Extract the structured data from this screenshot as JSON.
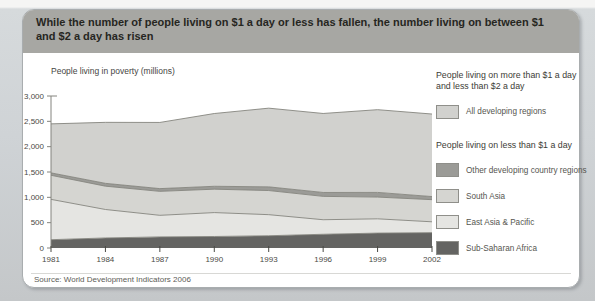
{
  "title": "While the number of people living on $1 a day or less has fallen, the number living on between $1 and $2 a day has risen",
  "source": "Source: World Development Indicators 2006",
  "colors": {
    "card_background": "#ffffff",
    "titlebar_background": "#a7a7a3",
    "page_background": "#cfd3d6",
    "axis": "#84847e",
    "sub_saharan_africa": "#646462",
    "east_asia_pacific": "#e5e5e2",
    "south_asia": "#d5d5d1",
    "other_developing": "#9b9b97",
    "all_developing_between_1_and_2": "#d1d1ce"
  },
  "chart_data": {
    "type": "area",
    "stacked": true,
    "ylabel": "People living in poverty (millions)",
    "xlabel": "",
    "grid": false,
    "ylim": [
      0,
      3000
    ],
    "years": [
      1981,
      1984,
      1987,
      1990,
      1993,
      1996,
      1999,
      2002
    ],
    "x_tick_labels": [
      "1981",
      "1984",
      "1987",
      "1990",
      "1993",
      "1996",
      "1999",
      "2002"
    ],
    "y_ticks": [
      0,
      500,
      1000,
      1500,
      2000,
      2500,
      3000
    ],
    "y_tick_labels": [
      "0",
      "500",
      "1,000",
      "1,500",
      "2,000",
      "2,500",
      "3,000"
    ],
    "series": [
      {
        "name": "Sub-Saharan Africa",
        "group": "less than $1 a day",
        "color": "#646462",
        "values": [
          164,
          198,
          219,
          227,
          242,
          271,
          294,
          303
        ]
      },
      {
        "name": "East Asia & Pacific",
        "group": "less than $1 a day",
        "color": "#e5e5e2",
        "values": [
          796,
          562,
          426,
          472,
          416,
          287,
          282,
          214
        ]
      },
      {
        "name": "South Asia",
        "group": "less than $1 a day",
        "color": "#d5d5d1",
        "values": [
          475,
          460,
          473,
          462,
          476,
          461,
          429,
          437
        ]
      },
      {
        "name": "Other developing country regions",
        "group": "less than $1 a day",
        "color": "#9b9b97",
        "values": [
          48,
          56,
          54,
          57,
          73,
          77,
          92,
          61
        ]
      },
      {
        "name": "All developing regions",
        "group": "more than $1 and less than $2 a day",
        "color": "#d1d1ce",
        "values": [
          967,
          1204,
          1306,
          1436,
          1553,
          1559,
          1633,
          1629
        ]
      }
    ],
    "derived_totals": {
      "under_1_dollar": [
        1483,
        1276,
        1172,
        1218,
        1207,
        1096,
        1097,
        1015
      ],
      "under_2_dollars": [
        2450,
        2480,
        2478,
        2654,
        2760,
        2655,
        2730,
        2644
      ]
    },
    "legend_position": "right"
  },
  "legend": {
    "sections": [
      {
        "heading": "People living on more than $1 a day and less than $2 a day",
        "items": [
          {
            "label": "All developing regions",
            "color": "#d1d1ce"
          }
        ]
      },
      {
        "heading": "People living on less than $1 a day",
        "items": [
          {
            "label": "Other developing country regions",
            "color": "#9b9b97"
          },
          {
            "label": "South Asia",
            "color": "#d5d5d1"
          },
          {
            "label": "East Asia & Pacific",
            "color": "#e5e5e2"
          },
          {
            "label": "Sub-Saharan Africa",
            "color": "#646462"
          }
        ]
      }
    ]
  }
}
